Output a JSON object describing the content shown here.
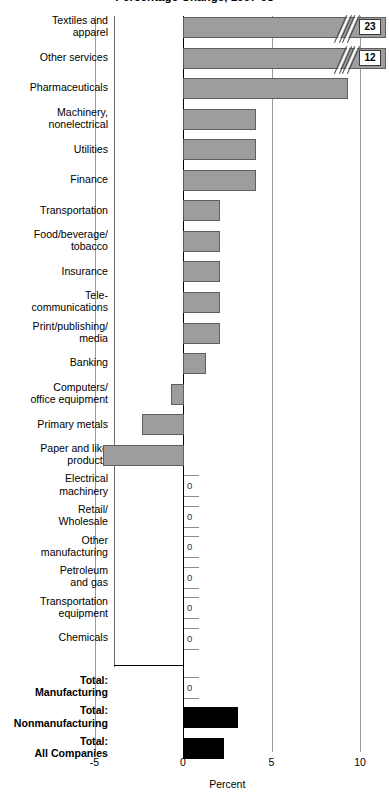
{
  "chart_data": {
    "type": "bar",
    "title": "Percentage Change, 1997-98",
    "xlabel": "Percent",
    "ylabel": "",
    "orientation": "horizontal",
    "xlim": [
      -5,
      10
    ],
    "xticks": [
      -5,
      0,
      5,
      10
    ],
    "xticklabels": [
      "-5",
      "0",
      "5",
      "10"
    ],
    "grid": "vertical-at-xticks",
    "legend": "none",
    "note": "Two bars are axis-broken; their true values are shown in callout boxes.",
    "categories": [
      "Textiles and\napparel",
      "Other services",
      "Pharmaceuticals",
      "Machinery,\nnonelectrical",
      "Utilities",
      "Finance",
      "Transportation",
      "Food/beverage/\ntobacco",
      "Insurance",
      "Tele-\ncommunications",
      "Print/publishing/\nmedia",
      "Banking",
      "Computers/\noffice equipment",
      "Primary metals",
      "Paper and like\nproducts",
      "Electrical\nmachinery",
      "Retail/\nWholesale",
      "Other\nmanufacturing",
      "Petroleum\nand gas",
      "Transportation\nequipment",
      "Chemicals",
      "Total:\nManufacturing",
      "Total:\nNonmanufacturing",
      "Total:\nAll Companies"
    ],
    "values": [
      23,
      12,
      9.3,
      4.1,
      4.1,
      4.1,
      2.1,
      2.1,
      2.1,
      2.1,
      2.1,
      1.3,
      -0.7,
      -2.3,
      -4.9,
      0,
      0,
      0,
      0,
      0,
      0,
      0,
      3.1,
      2.3
    ],
    "data_labels": {
      "Textiles and\napparel": "23",
      "Other services": "12",
      "Electrical\nmachinery": "0",
      "Retail/\nWholesale": "0",
      "Other\nmanufacturing": "0",
      "Petroleum\nand gas": "0",
      "Transportation\nequipment": "0",
      "Chemicals": "0",
      "Total:\nManufacturing": "0"
    },
    "series_styles": {
      "industry_fill": "#9d9d9d",
      "industry_stroke": "#5e5e5e",
      "total_fill": "#000000"
    }
  },
  "colors": {
    "bar_gray": "#9d9d9d",
    "bar_gray_edge": "#5e5e5e",
    "bar_black": "#000000",
    "gridline": "#9a9a9a",
    "axis": "#000000",
    "background": "#ffffff"
  }
}
